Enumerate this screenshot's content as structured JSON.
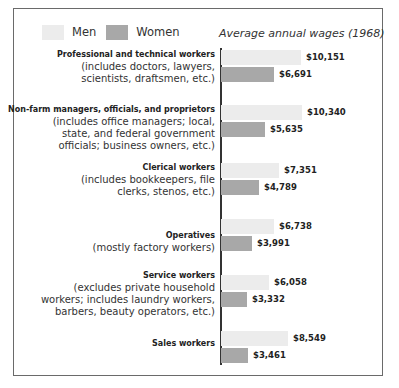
{
  "legend": [
    {
      "label": "Men",
      "color": "#ececec"
    },
    {
      "label": "Women",
      "color": "#a8a8a8"
    }
  ],
  "chart_title": "Average annual wages (1968)",
  "chart_data": {
    "type": "bar",
    "orientation": "horizontal",
    "title": "Average annual wages (1968)",
    "xlabel": "",
    "ylabel": "",
    "grid": false,
    "legend_position": "top-left",
    "categories": [
      "Professional and technical workers",
      "Non-farm managers, officials, and proprietors",
      "Clerical workers",
      "Operatives",
      "Service workers",
      "Sales workers"
    ],
    "series": [
      {
        "name": "Men",
        "values": [
          10151,
          10340,
          7351,
          6738,
          6058,
          8549
        ]
      },
      {
        "name": "Women",
        "values": [
          6691,
          5635,
          4789,
          3991,
          3332,
          3461
        ]
      }
    ],
    "value_labels": {
      "Men": [
        "$10,151",
        "$10,340",
        "$7,351",
        "$6,738",
        "$6,058",
        "$8,549"
      ],
      "Women": [
        "$6,691",
        "$5,635",
        "$4,789",
        "$3,991",
        "$3,332",
        "$3,461"
      ]
    }
  },
  "groups": [
    {
      "name": "Professional and technical workers",
      "desc": [
        "(includes doctors, lawyers,",
        "scientists, draftsmen, etc.)"
      ],
      "men": {
        "value": 10151,
        "label": "$10,151"
      },
      "women": {
        "value": 6691,
        "label": "$6,691"
      }
    },
    {
      "name": "Non-farm managers, officials, and proprietors",
      "desc": [
        "(includes office managers; local,",
        "state, and federal government",
        "officials; business owners, etc.)"
      ],
      "men": {
        "value": 10340,
        "label": "$10,340"
      },
      "women": {
        "value": 5635,
        "label": "$5,635"
      }
    },
    {
      "name": "Clerical workers",
      "desc": [
        "(includes bookkeepers, file",
        "clerks, stenos, etc.)"
      ],
      "men": {
        "value": 7351,
        "label": "$7,351"
      },
      "women": {
        "value": 4789,
        "label": "$4,789"
      }
    },
    {
      "name": "Operatives",
      "desc": [
        "(mostly factory workers)"
      ],
      "men": {
        "value": 6738,
        "label": "$6,738"
      },
      "women": {
        "value": 3991,
        "label": "$3,991"
      }
    },
    {
      "name": "Service workers",
      "desc": [
        "(excludes private household",
        "workers; includes laundry workers,",
        "barbers, beauty operators, etc.)"
      ],
      "men": {
        "value": 6058,
        "label": "$6,058"
      },
      "women": {
        "value": 3332,
        "label": "$3,332"
      }
    },
    {
      "name": "Sales workers",
      "desc": [],
      "men": {
        "value": 8549,
        "label": "$8,549"
      },
      "women": {
        "value": 3461,
        "label": "$3,461"
      }
    }
  ]
}
